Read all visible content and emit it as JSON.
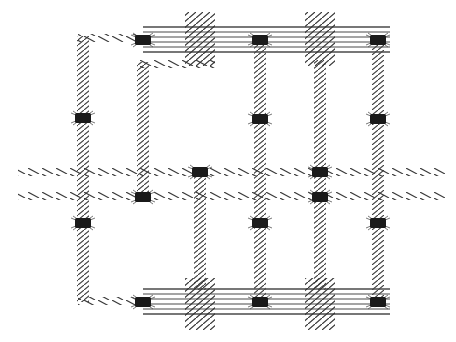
{
  "diagram": {
    "kind": "hatched wiring / interconnect layout",
    "width": 456,
    "height": 342,
    "colors": {
      "background": "#ffffff",
      "trace": "#3a3a3a",
      "pad": "#1a1a1a",
      "bus_line": "#4a4a4a"
    },
    "buses": [
      {
        "id": "top-bus",
        "x1": 143,
        "x2": 390,
        "y_lines": [
          27,
          32,
          37,
          42,
          47,
          52
        ]
      },
      {
        "id": "bottom-bus",
        "x1": 143,
        "x2": 390,
        "y_lines": [
          289,
          294,
          299,
          304,
          309,
          314
        ]
      }
    ],
    "crossings": [
      {
        "id": "top-cross-1",
        "x": 185,
        "y": 12,
        "w": 30,
        "h": 54
      },
      {
        "id": "top-cross-2",
        "x": 305,
        "y": 12,
        "w": 30,
        "h": 54
      },
      {
        "id": "bottom-cross-1",
        "x": 185,
        "y": 278,
        "w": 30,
        "h": 52
      },
      {
        "id": "bottom-cross-2",
        "x": 305,
        "y": 278,
        "w": 30,
        "h": 52
      }
    ],
    "horizontal_traces": [
      {
        "id": "h-trace-upper",
        "x1": 18,
        "x2": 445,
        "y": 172
      },
      {
        "id": "h-trace-lower",
        "x1": 18,
        "x2": 445,
        "y": 196
      },
      {
        "id": "h-left-top",
        "x1": 78,
        "x2": 143,
        "y": 38
      },
      {
        "id": "h-left-bottom",
        "x1": 78,
        "x2": 143,
        "y": 301
      },
      {
        "id": "h-inner-top",
        "x1": 138,
        "x2": 215,
        "y": 64
      }
    ],
    "vertical_traces": [
      {
        "id": "v-col-1",
        "x": 83,
        "y1": 36,
        "y2": 302
      },
      {
        "id": "v-col-2",
        "x": 143,
        "y1": 62,
        "y2": 198
      },
      {
        "id": "v-col-3",
        "x": 200,
        "y1": 172,
        "y2": 290
      },
      {
        "id": "v-col-4",
        "x": 260,
        "y1": 40,
        "y2": 302
      },
      {
        "id": "v-col-5",
        "x": 320,
        "y1": 60,
        "y2": 290
      },
      {
        "id": "v-col-6",
        "x": 378,
        "y1": 40,
        "y2": 302
      }
    ],
    "pads": [
      {
        "id": "pad-1",
        "x": 143,
        "y": 40
      },
      {
        "id": "pad-2",
        "x": 260,
        "y": 40
      },
      {
        "id": "pad-3",
        "x": 378,
        "y": 40
      },
      {
        "id": "pad-4",
        "x": 83,
        "y": 118
      },
      {
        "id": "pad-5",
        "x": 260,
        "y": 119
      },
      {
        "id": "pad-6",
        "x": 378,
        "y": 119
      },
      {
        "id": "pad-7",
        "x": 200,
        "y": 172
      },
      {
        "id": "pad-8",
        "x": 320,
        "y": 172
      },
      {
        "id": "pad-9",
        "x": 143,
        "y": 197
      },
      {
        "id": "pad-10",
        "x": 320,
        "y": 197
      },
      {
        "id": "pad-11",
        "x": 83,
        "y": 223
      },
      {
        "id": "pad-12",
        "x": 260,
        "y": 223
      },
      {
        "id": "pad-13",
        "x": 378,
        "y": 223
      },
      {
        "id": "pad-14",
        "x": 143,
        "y": 302
      },
      {
        "id": "pad-15",
        "x": 260,
        "y": 302
      },
      {
        "id": "pad-16",
        "x": 378,
        "y": 302
      }
    ]
  }
}
